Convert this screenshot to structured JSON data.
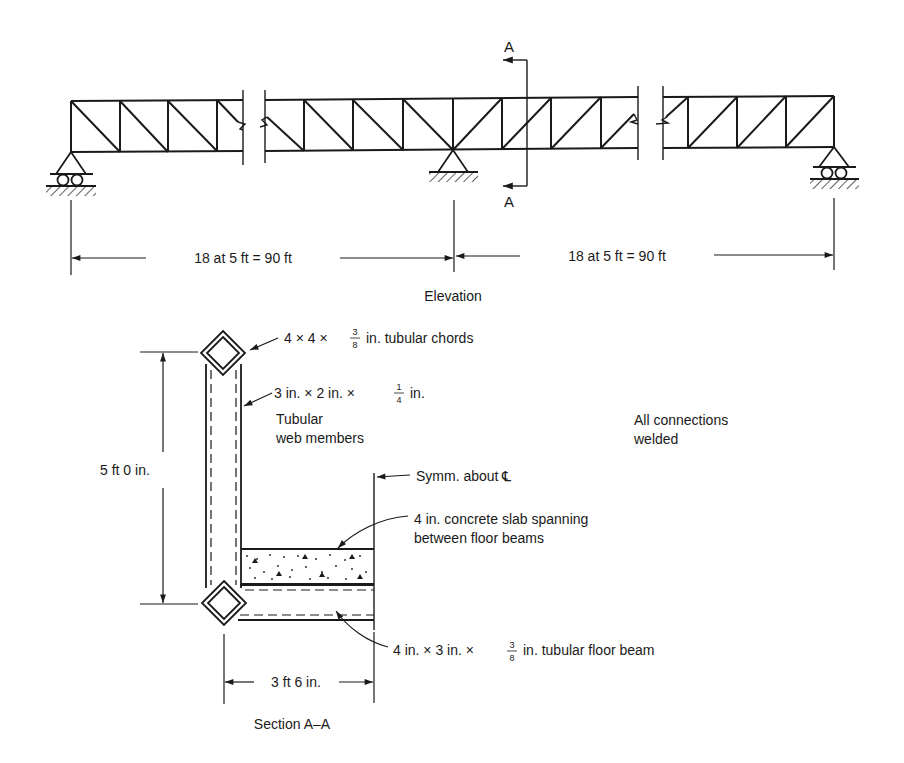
{
  "elevation": {
    "section_marker_top": "A",
    "section_marker_bottom": "A",
    "dim_left": "18 at 5 ft = 90 ft",
    "dim_right": "18 at 5 ft = 90 ft",
    "caption": "Elevation"
  },
  "section": {
    "chord_label": {
      "pre": "4 × 4 ×",
      "num": "3",
      "den": "8",
      "post": "in. tubular chords"
    },
    "web_label": {
      "pre": "3 in. × 2 in. ×",
      "num": "1",
      "den": "4",
      "post": "in."
    },
    "web_line2": "Tubular",
    "web_line3": "web members",
    "height_dim": "5 ft 0 in.",
    "symm_label": "Symm. about ℄",
    "slab_line1": "4 in. concrete slab spanning",
    "slab_line2": "between floor beams",
    "beam_label": {
      "pre": "4 in. × 3 in. ×",
      "num": "3",
      "den": "8",
      "post": "in. tubular floor beam"
    },
    "width_dim": "3 ft 6 in.",
    "caption": "Section A–A"
  },
  "note": {
    "line1": "All connections",
    "line2": "welded"
  }
}
